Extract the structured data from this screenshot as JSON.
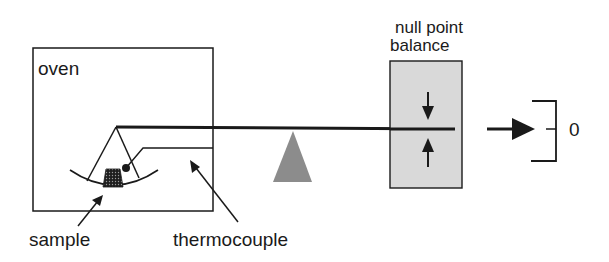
{
  "diagram": {
    "labels": {
      "oven": "oven",
      "balance_line1": "null point",
      "balance_line2": "balance",
      "sample": "sample",
      "thermocouple": "thermocouple",
      "output_zero": "0"
    },
    "colors": {
      "stroke": "#1a1a1a",
      "fulcrum": "#8c8c8c",
      "balance_fill": "#d9d9d9",
      "sample_fill": "#2a2a2a"
    }
  }
}
